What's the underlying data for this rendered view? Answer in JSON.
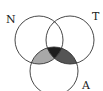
{
  "diagram": {
    "type": "venn",
    "sets": [
      {
        "label": "N",
        "cx": 39,
        "cy": 40,
        "r": 24
      },
      {
        "label": "T",
        "cx": 70,
        "cy": 40,
        "r": 24
      },
      {
        "label": "A",
        "cx": 54,
        "cy": 71,
        "r": 24
      }
    ],
    "shaded_regions": [
      {
        "region": "N∩A only",
        "color": "#a8a8a8"
      },
      {
        "region": "T∩A only",
        "color": "#555555"
      },
      {
        "region": "N∩T∩A",
        "color": "#1e1e1e"
      }
    ],
    "stroke_color": "#333333"
  }
}
